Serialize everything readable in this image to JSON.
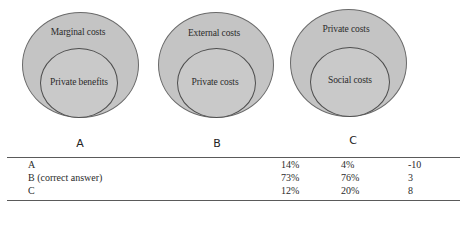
{
  "diagrams": [
    {
      "option": "A",
      "outer_label": "Marginal costs",
      "inner_label": "Private benefits"
    },
    {
      "option": "B",
      "outer_label": "External costs",
      "inner_label": "Private costs"
    },
    {
      "option": "C",
      "outer_label": "Private costs",
      "inner_label": "Social costs"
    }
  ],
  "table": {
    "rows": [
      {
        "label": "A",
        "v1": "14%",
        "v2": "4%",
        "v3": "-10"
      },
      {
        "label": "B (correct answer)",
        "v1": "73%",
        "v2": "76%",
        "v3": "3"
      },
      {
        "label": "C",
        "v1": "12%",
        "v2": "20%",
        "v3": "8"
      }
    ]
  },
  "colors": {
    "circle_fill": "#c4c4c4",
    "circle_border": "#5a5a5a",
    "rule": "#5a5a5a"
  }
}
